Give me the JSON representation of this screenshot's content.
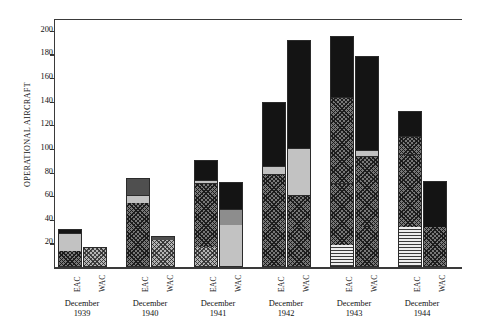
{
  "chart_data": {
    "type": "bar",
    "title": "",
    "subtitle": "",
    "xlabel": "",
    "ylabel": "OPERATIONAL AIRCRAFT",
    "ylim": [
      0,
      210
    ],
    "ytick_labels": [
      "20",
      "40",
      "60",
      "80",
      "100",
      "120",
      "140",
      "160",
      "180",
      "200"
    ],
    "ytick_values": [
      20,
      40,
      60,
      80,
      100,
      120,
      140,
      160,
      180,
      200
    ],
    "grid": false,
    "legend": "none",
    "stacked": true,
    "categories": [
      "December 1939",
      "December 1940",
      "December 1941",
      "December 1942",
      "December 1943",
      "December 1944"
    ],
    "group_labels": [
      {
        "month": "December",
        "year": "1939"
      },
      {
        "month": "December",
        "year": "1940"
      },
      {
        "month": "December",
        "year": "1941"
      },
      {
        "month": "December",
        "year": "1942"
      },
      {
        "month": "December",
        "year": "1943"
      },
      {
        "month": "December",
        "year": "1944"
      }
    ],
    "series_tick_labels": [
      "EAC",
      "WAC"
    ],
    "bars": [
      {
        "group": "December 1939",
        "series": "EAC",
        "total": 32,
        "segments": [
          {
            "value": 13,
            "fill": "crosshatch"
          },
          {
            "value": 15,
            "fill": "lightgray"
          },
          {
            "value": 4,
            "fill": "black"
          }
        ]
      },
      {
        "group": "December 1939",
        "series": "WAC",
        "total": 17,
        "segments": [
          {
            "value": 17,
            "fill": "dots"
          }
        ]
      },
      {
        "group": "December 1940",
        "series": "EAC",
        "total": 75,
        "segments": [
          {
            "value": 53,
            "fill": "crosshatch"
          },
          {
            "value": 7,
            "fill": "lightgray"
          },
          {
            "value": 15,
            "fill": "darkgray"
          }
        ]
      },
      {
        "group": "December 1940",
        "series": "WAC",
        "total": 26,
        "segments": [
          {
            "value": 22,
            "fill": "dots"
          },
          {
            "value": 4,
            "fill": "darkgray"
          }
        ]
      },
      {
        "group": "December 1941",
        "series": "EAC",
        "total": 91,
        "segments": [
          {
            "value": 16,
            "fill": "dots"
          },
          {
            "value": 54,
            "fill": "crosshatch"
          },
          {
            "value": 3,
            "fill": "lightgray"
          },
          {
            "value": 18,
            "fill": "black"
          }
        ]
      },
      {
        "group": "December 1941",
        "series": "WAC",
        "total": 72,
        "segments": [
          {
            "value": 35,
            "fill": "lightgray"
          },
          {
            "value": 13,
            "fill": "midgray"
          },
          {
            "value": 24,
            "fill": "black"
          }
        ]
      },
      {
        "group": "December 1942",
        "series": "EAC",
        "total": 140,
        "segments": [
          {
            "value": 32,
            "fill": "crosshatch"
          },
          {
            "value": 46,
            "fill": "crosshatch"
          },
          {
            "value": 7,
            "fill": "lightgray"
          },
          {
            "value": 55,
            "fill": "black"
          }
        ]
      },
      {
        "group": "December 1942",
        "series": "WAC",
        "total": 192,
        "segments": [
          {
            "value": 32,
            "fill": "crosshatch"
          },
          {
            "value": 28,
            "fill": "crosshatch"
          },
          {
            "value": 40,
            "fill": "lightgray"
          },
          {
            "value": 92,
            "fill": "black"
          }
        ]
      },
      {
        "group": "December 1943",
        "series": "EAC",
        "total": 196,
        "segments": [
          {
            "value": 18,
            "fill": "hlines"
          },
          {
            "value": 52,
            "fill": "crosshatch"
          },
          {
            "value": 73,
            "fill": "crosshatch"
          },
          {
            "value": 53,
            "fill": "black"
          }
        ]
      },
      {
        "group": "December 1943",
        "series": "WAC",
        "total": 179,
        "segments": [
          {
            "value": 34,
            "fill": "crosshatch"
          },
          {
            "value": 59,
            "fill": "crosshatch"
          },
          {
            "value": 5,
            "fill": "lightgray"
          },
          {
            "value": 81,
            "fill": "black"
          }
        ]
      },
      {
        "group": "December 1944",
        "series": "EAC",
        "total": 132,
        "segments": [
          {
            "value": 33,
            "fill": "hlines"
          },
          {
            "value": 62,
            "fill": "crosshatch"
          },
          {
            "value": 15,
            "fill": "crosshatch"
          },
          {
            "value": 22,
            "fill": "black"
          }
        ]
      },
      {
        "group": "December 1944",
        "series": "WAC",
        "total": 73,
        "segments": [
          {
            "value": 33,
            "fill": "crosshatch"
          },
          {
            "value": 40,
            "fill": "black"
          }
        ]
      }
    ],
    "colors": {
      "black": "#141414",
      "darkgray": "#4f4f4f",
      "midgray": "#8d8d8d",
      "lightgray": "#c2c2c2",
      "crosshatch": "#787878",
      "dots": "#b5b5b5",
      "hlines": "#e4e4e4",
      "axis": "#3a3a3a",
      "background": "#ffffff"
    }
  }
}
